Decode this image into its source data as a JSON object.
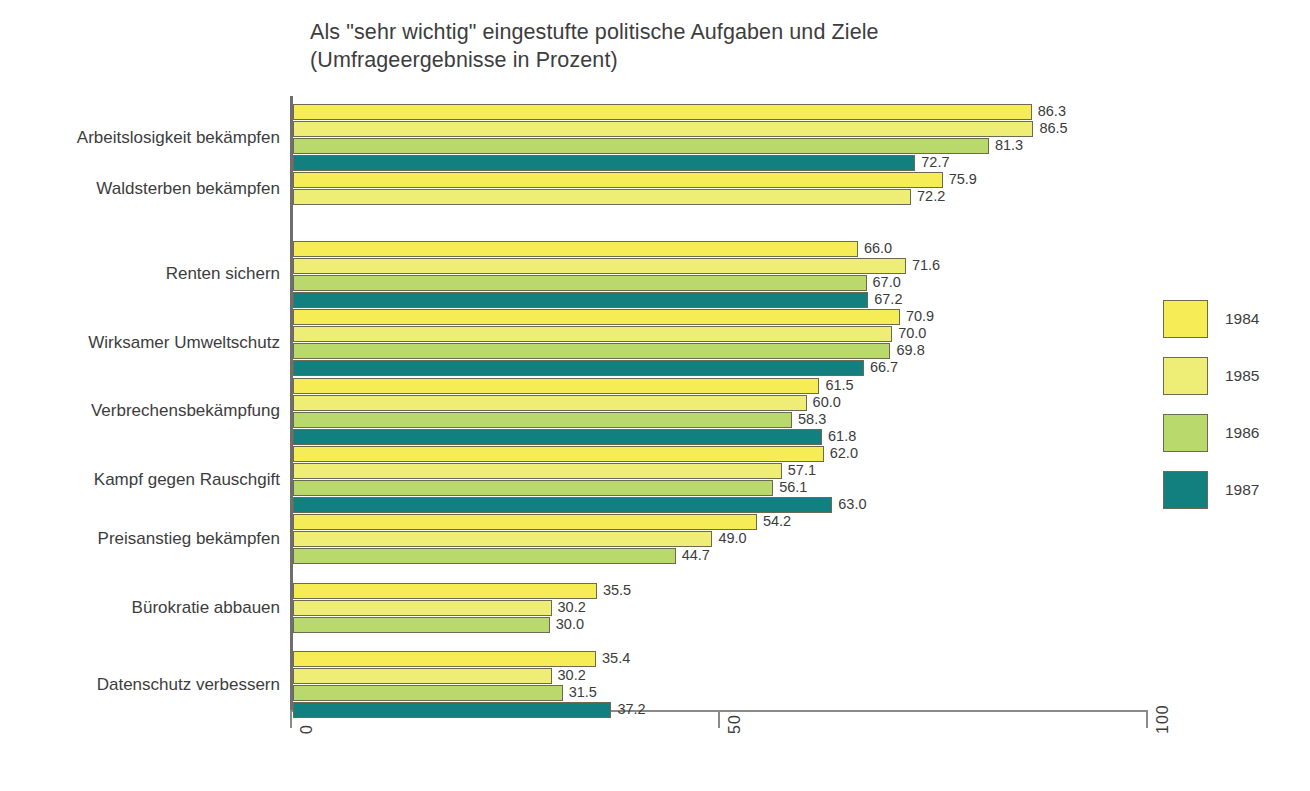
{
  "chart_data": {
    "type": "bar",
    "orientation": "horizontal",
    "title": "Als \"sehr wichtig\" eingestufte politische Aufgaben und Ziele",
    "subtitle": "(Umfrageergebnisse in Prozent)",
    "xlabel": "",
    "ylabel": "",
    "xlim": [
      0,
      100
    ],
    "xticks": [
      "0",
      "50",
      "100"
    ],
    "xtick_values": [
      0,
      50,
      100
    ],
    "grid": false,
    "legend_position": "right",
    "categories": [
      "Arbeitslosigkeit bekämpfen",
      "Waldsterben bekämpfen",
      "Renten sichern",
      "Wirksamer Umweltschutz",
      "Verbrechensbekämpfung",
      "Kampf gegen Rauschgift",
      "Preisanstieg bekämpfen",
      "Bürokratie abbauen",
      "Datenschutz verbessern"
    ],
    "series": [
      {
        "name": "1984",
        "color": "#f5ec56",
        "values": [
          86.3,
          75.9,
          66.0,
          70.9,
          61.5,
          62.0,
          54.2,
          35.5,
          35.4
        ],
        "labels": [
          "86.3",
          "75.9",
          "66.0",
          "70.9",
          "61.5",
          "62.0",
          "54.2",
          "35.5",
          "35.4"
        ]
      },
      {
        "name": "1985",
        "color": "#eeee77",
        "values": [
          86.5,
          72.2,
          71.6,
          70.0,
          60.0,
          57.1,
          49.0,
          30.2,
          30.2
        ],
        "labels": [
          "86.5",
          "72.2",
          "71.6",
          "70.0",
          "60.0",
          "57.1",
          "49.0",
          "30.2",
          "30.2"
        ]
      },
      {
        "name": "1986",
        "color": "#b9d96c",
        "values": [
          81.3,
          null,
          67.0,
          69.8,
          58.3,
          56.1,
          44.7,
          30.0,
          31.5
        ],
        "labels": [
          "81.3",
          "",
          "67.0",
          "69.8",
          "58.3",
          "56.1",
          "44.7",
          "30.0",
          "31.5"
        ]
      },
      {
        "name": "1987",
        "color": "#11807f",
        "values": [
          72.7,
          null,
          67.2,
          66.7,
          61.8,
          63.0,
          null,
          null,
          37.2
        ],
        "labels": [
          "72.7",
          "",
          "67.2",
          "66.7",
          "61.8",
          "63.0",
          "",
          "",
          "37.2"
        ]
      }
    ]
  },
  "legend": {
    "items": [
      {
        "label": "1984",
        "color": "#f5ec56"
      },
      {
        "label": "1985",
        "color": "#eeee77"
      },
      {
        "label": "1986",
        "color": "#b9d96c"
      },
      {
        "label": "1987",
        "color": "#11807f"
      }
    ]
  }
}
